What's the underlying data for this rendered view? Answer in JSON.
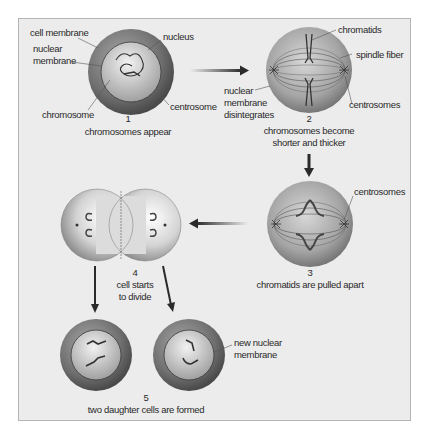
{
  "colors": {
    "background": "#ececec",
    "frame_border": "#b4b4b4",
    "cell_outer": "#6e6e6e",
    "cell_highlight": "#d8d8d8",
    "nucleus": "#bdbdbd",
    "line": "#3a3a3a",
    "arrow": "#2a2a2a"
  },
  "stages": [
    {
      "number": "1",
      "caption": "chromosomes appear",
      "labels": {
        "cell_membrane": "cell membrane",
        "nuclear_membrane_1": "nuclear",
        "nuclear_membrane_2": "membrane",
        "chromosome": "chromosome",
        "nucleus": "nucleus",
        "centrosome": "centrosome"
      }
    },
    {
      "number": "2",
      "caption_1": "chromosomes become",
      "caption_2": "shorter and thicker",
      "labels": {
        "chromatids": "chromatids",
        "spindle_fiber": "spindle fiber",
        "nuclear_disintegrates_1": "nuclear",
        "nuclear_disintegrates_2": "membrane",
        "nuclear_disintegrates_3": "disintegrates",
        "centrosomes": "centrosomes"
      }
    },
    {
      "number": "3",
      "caption": "chromatids are pulled apart",
      "labels": {
        "centrosomes": "centrosomes"
      }
    },
    {
      "number": "4",
      "caption_1": "cell starts",
      "caption_2": "to divide"
    },
    {
      "number": "5",
      "caption": "two daughter cells are formed",
      "labels": {
        "new_nuclear_1": "new nuclear",
        "new_nuclear_2": "membrane"
      }
    }
  ],
  "arrows": [
    {
      "from": "1",
      "to": "2",
      "direction": "right"
    },
    {
      "from": "2",
      "to": "3",
      "direction": "down"
    },
    {
      "from": "3",
      "to": "4",
      "direction": "left"
    },
    {
      "from": "4",
      "to": "5-left",
      "direction": "down"
    },
    {
      "from": "4",
      "to": "5-right",
      "direction": "down-right"
    }
  ]
}
